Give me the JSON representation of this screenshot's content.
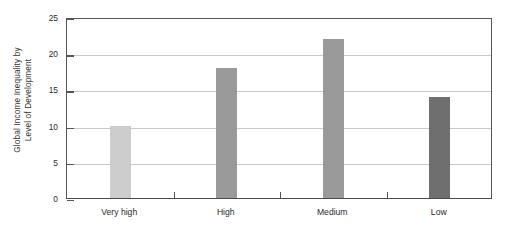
{
  "chart_data": {
    "type": "bar",
    "title": "",
    "subtitle": "",
    "xlabel": "",
    "ylabel": "Global Income Inequality by Level of Development",
    "ylabel_line1": "Global Income Inequality by",
    "ylabel_line2": "Level of Development",
    "categories": [
      "Very high",
      "High",
      "Medium",
      "Low"
    ],
    "values": [
      10,
      18,
      22,
      14
    ],
    "ylim": [
      0,
      25
    ],
    "yticks": [
      0,
      5,
      10,
      15,
      20,
      25
    ],
    "ytick_labels": [
      "0",
      "5",
      "10",
      "15",
      "20",
      "25"
    ],
    "grid": true,
    "legend": "none",
    "bar_colors": [
      "#cdcdcd",
      "#9a9a9a",
      "#9a9a9a",
      "#6f6f6f"
    ],
    "axis_color": "#555555",
    "gridline_color": "#c9c9c9",
    "background": "#ffffff"
  }
}
